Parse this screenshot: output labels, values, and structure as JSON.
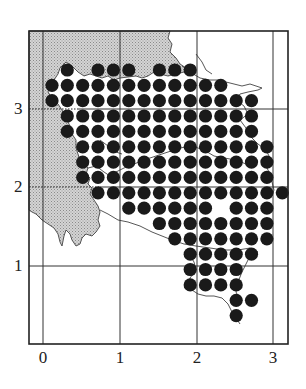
{
  "map": {
    "type": "grid-dot-distribution-map",
    "frame": {
      "left": 29,
      "top": 31,
      "right": 288,
      "bottom": 344
    },
    "x_axis": {
      "ticks": [
        {
          "label": "0",
          "px": 43
        },
        {
          "label": "1",
          "px": 120
        },
        {
          "label": "2",
          "px": 197
        },
        {
          "label": "3",
          "px": 273
        }
      ]
    },
    "y_axis": {
      "ticks": [
        {
          "label": "3",
          "px": 109
        },
        {
          "label": "2",
          "px": 187
        },
        {
          "label": "1",
          "px": 266
        }
      ]
    },
    "colors": {
      "dot": "#1a1a1a",
      "frame": "#222222",
      "grid": "#333333",
      "sea_shade": "#c8c8c8",
      "coastline": "#444444"
    },
    "dot_grid": {
      "col0_x": 52,
      "row0_y": 70,
      "spacing": 15.35,
      "radius": 6.6,
      "rows": [
        {
          "row": 0,
          "cols": [
            1,
            3,
            4,
            5,
            7,
            8,
            9
          ]
        },
        {
          "row": 1,
          "cols": [
            0,
            1,
            2,
            3,
            4,
            5,
            6,
            7,
            8,
            9,
            10,
            11
          ]
        },
        {
          "row": 2,
          "cols": [
            0,
            1,
            2,
            3,
            4,
            5,
            6,
            7,
            8,
            9,
            10,
            11,
            12,
            13
          ]
        },
        {
          "row": 3,
          "cols": [
            1,
            2,
            3,
            4,
            5,
            6,
            7,
            8,
            9,
            10,
            11,
            12,
            13
          ]
        },
        {
          "row": 4,
          "cols": [
            1,
            2,
            3,
            4,
            5,
            6,
            7,
            8,
            9,
            10,
            11,
            12,
            13
          ]
        },
        {
          "row": 5,
          "cols": [
            2,
            3,
            4,
            5,
            6,
            7,
            8,
            9,
            10,
            11,
            12,
            13,
            14
          ]
        },
        {
          "row": 6,
          "cols": [
            2,
            3,
            4,
            5,
            6,
            7,
            8,
            9,
            10,
            11,
            12,
            13,
            14
          ]
        },
        {
          "row": 7,
          "cols": [
            2,
            3,
            4,
            5,
            6,
            7,
            8,
            9,
            10,
            11,
            12,
            13,
            14
          ]
        },
        {
          "row": 8,
          "cols": [
            3,
            4,
            5,
            6,
            7,
            8,
            9,
            10,
            11,
            12,
            13,
            14,
            15
          ]
        },
        {
          "row": 9,
          "cols": [
            5,
            6,
            7,
            8,
            9,
            10,
            12,
            13,
            14
          ]
        },
        {
          "row": 10,
          "cols": [
            7,
            8,
            9,
            10,
            11,
            12,
            13,
            14
          ]
        },
        {
          "row": 11,
          "cols": [
            8,
            9,
            10,
            11,
            12,
            13,
            14
          ]
        },
        {
          "row": 12,
          "cols": [
            9,
            10,
            11,
            12,
            13
          ]
        },
        {
          "row": 13,
          "cols": [
            9,
            10,
            11,
            12
          ]
        },
        {
          "row": 14,
          "cols": [
            9,
            10,
            11,
            12
          ]
        },
        {
          "row": 15,
          "cols": [
            12,
            13
          ]
        },
        {
          "row": 16,
          "cols": [
            12
          ]
        }
      ]
    }
  }
}
